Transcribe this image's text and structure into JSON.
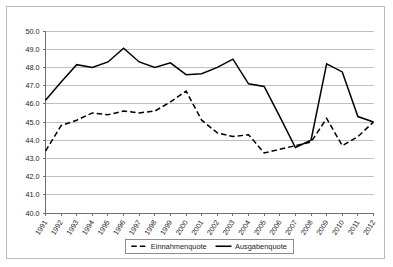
{
  "chart_data": {
    "type": "line",
    "title": "",
    "subtitle": "",
    "xlabel": "",
    "ylabel": "",
    "grid": true,
    "legend_position": "bottom",
    "ylim": [
      40.0,
      50.0
    ],
    "ytick_labels": [
      "50.0",
      "49.0",
      "48.0",
      "47.0",
      "46.0",
      "45.0",
      "44.0",
      "43.0",
      "42.0",
      "41.0",
      "40.0"
    ],
    "ytick_values": [
      50.0,
      49.0,
      48.0,
      47.0,
      46.0,
      45.0,
      44.0,
      43.0,
      42.0,
      41.0,
      40.0
    ],
    "categories": [
      "1991",
      "1992",
      "1993",
      "1994",
      "1995",
      "1996",
      "1997",
      "1998",
      "1999",
      "2000",
      "2001",
      "2002",
      "2003",
      "2004",
      "2005",
      "2006",
      "2007",
      "2008",
      "2009",
      "2010",
      "2011",
      "2012"
    ],
    "x": [
      1991,
      1992,
      1993,
      1994,
      1995,
      1996,
      1997,
      1998,
      1999,
      2000,
      2001,
      2002,
      2003,
      2004,
      2005,
      2006,
      2007,
      2008,
      2009,
      2010,
      2011,
      2012
    ],
    "series": [
      {
        "name": "Einnahmenquote",
        "style": "dashed",
        "color": "#000000",
        "values": [
          43.4,
          44.8,
          45.1,
          45.5,
          45.4,
          45.6,
          45.5,
          45.6,
          46.1,
          46.7,
          45.1,
          44.4,
          44.2,
          44.3,
          43.3,
          43.5,
          43.7,
          43.9,
          45.2,
          43.7,
          44.2,
          45.0
        ]
      },
      {
        "name": "Ausgabenquote",
        "style": "solid",
        "color": "#000000",
        "values": [
          46.2,
          47.2,
          48.15,
          48.0,
          48.3,
          49.05,
          48.3,
          48.0,
          48.25,
          47.6,
          47.65,
          48.0,
          48.45,
          47.1,
          46.95,
          45.3,
          43.6,
          44.0,
          48.2,
          47.75,
          45.3,
          45.0
        ]
      }
    ]
  },
  "legend": {
    "entries": [
      {
        "label": "Einnahmenquote",
        "style": "dashed"
      },
      {
        "label": "Ausgabenquote",
        "style": "solid"
      }
    ]
  }
}
